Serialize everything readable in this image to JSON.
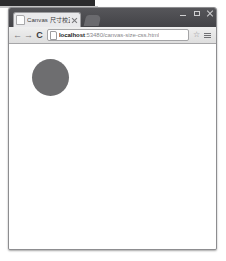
{
  "browser": {
    "window_controls": [
      {
        "name": "minimize",
        "label": "—"
      },
      {
        "name": "maximize",
        "label": "□"
      },
      {
        "name": "close",
        "label": "✕"
      }
    ],
    "tab": {
      "title": "Canvas 尺寸校正",
      "favicon": "page-icon",
      "close_label": "✕"
    },
    "new_tab_label": "+",
    "toolbar": {
      "back_label": "←",
      "forward_label": "→",
      "reload_label": "C",
      "star_label": "☆",
      "menu_label": "☰",
      "omnibox": {
        "host": "localhost",
        "rest": ":53480/canvas-size-css.html",
        "full_url": "localhost:53480/canvas-size-css.html",
        "placeholder": "Search Google or type a URL"
      }
    }
  },
  "page": {
    "background_color": "#ffffff",
    "shapes": [
      {
        "name": "canvas-circle",
        "type": "circle",
        "fill": "#6e6e70",
        "diameter_px": 37,
        "x_px": 23,
        "y_px": 14
      }
    ]
  }
}
